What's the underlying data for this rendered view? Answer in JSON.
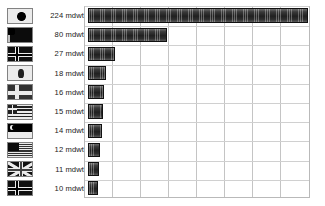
{
  "chart_data": {
    "type": "bar",
    "orientation": "horizontal",
    "title": "",
    "xlabel": "",
    "ylabel": "",
    "unit": "mdwt",
    "xlim": [
      0,
      230
    ],
    "grid": {
      "vertical": true,
      "horizontal": true,
      "vertical_step": 28.2
    },
    "categories": [
      "japan-flag",
      "china-flag",
      "norway-flag",
      "hong-kong-flag",
      "denmark-flag",
      "greece-flag",
      "singapore-flag",
      "united-states-flag",
      "united-kingdom-flag",
      "norway-flag-2"
    ],
    "values": [
      224,
      80,
      27,
      18,
      16,
      15,
      14,
      12,
      11,
      10
    ],
    "value_labels": [
      "224 mdwt",
      "80 mdwt",
      "27 mdwt",
      "18 mdwt",
      "16 mdwt",
      "15 mdwt",
      "14 mdwt",
      "12 mdwt",
      "11 mdwt",
      "10 mdwt"
    ],
    "bar_color": "#262626",
    "grid_color": "#c4c4c4",
    "background_color": "#ffffff"
  },
  "rows": [
    {
      "label": "224 mdwt",
      "value": 224,
      "flag": "japan-flag",
      "flag_class": "jp"
    },
    {
      "label": "80 mdwt",
      "value": 80,
      "flag": "china-flag",
      "flag_class": "cn"
    },
    {
      "label": "27 mdwt",
      "value": 27,
      "flag": "norway-flag",
      "flag_class": "nordic no"
    },
    {
      "label": "18 mdwt",
      "value": 18,
      "flag": "hong-kong-flag",
      "flag_class": "hk"
    },
    {
      "label": "16 mdwt",
      "value": 16,
      "flag": "denmark-flag",
      "flag_class": "nordic dk"
    },
    {
      "label": "15 mdwt",
      "value": 15,
      "flag": "greece-flag",
      "flag_class": "gr"
    },
    {
      "label": "14 mdwt",
      "value": 14,
      "flag": "singapore-flag",
      "flag_class": "sg"
    },
    {
      "label": "12 mdwt",
      "value": 12,
      "flag": "united-states-flag",
      "flag_class": "us"
    },
    {
      "label": "11 mdwt",
      "value": 11,
      "flag": "united-kingdom-flag",
      "flag_class": "uk"
    },
    {
      "label": "10 mdwt",
      "value": 10,
      "flag": "norway-flag-2",
      "flag_class": "nordic no"
    }
  ]
}
